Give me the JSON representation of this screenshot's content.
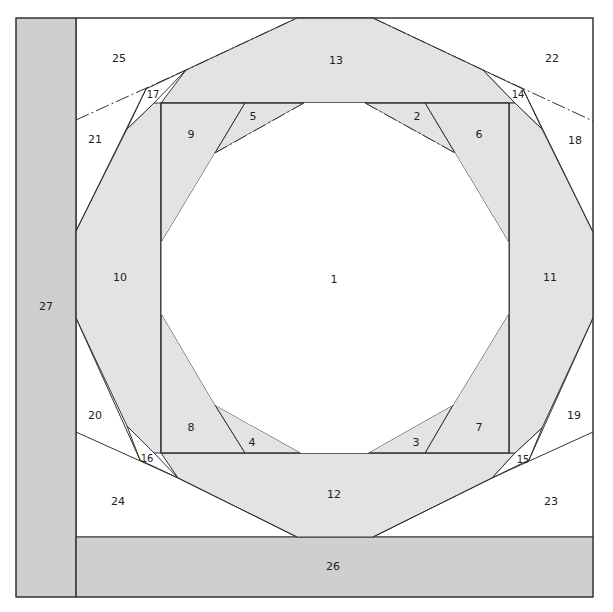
{
  "diagram": {
    "colors": {
      "light_shade": "#e3e3e3",
      "dark_shade": "#cfcfcf",
      "background": "#ffffff",
      "line": "#333333"
    },
    "pieces": [
      {
        "id": "1",
        "label": "1",
        "x": 334,
        "y": 279
      },
      {
        "id": "2",
        "label": "2",
        "x": 417,
        "y": 116
      },
      {
        "id": "3",
        "label": "3",
        "x": 416,
        "y": 442
      },
      {
        "id": "4",
        "label": "4",
        "x": 252,
        "y": 442
      },
      {
        "id": "5",
        "label": "5",
        "x": 253,
        "y": 116
      },
      {
        "id": "6",
        "label": "6",
        "x": 479,
        "y": 134
      },
      {
        "id": "7",
        "label": "7",
        "x": 479,
        "y": 427
      },
      {
        "id": "8",
        "label": "8",
        "x": 191,
        "y": 427
      },
      {
        "id": "9",
        "label": "9",
        "x": 191,
        "y": 134
      },
      {
        "id": "10",
        "label": "10",
        "x": 120,
        "y": 277
      },
      {
        "id": "11",
        "label": "11",
        "x": 550,
        "y": 277
      },
      {
        "id": "12",
        "label": "12",
        "x": 334,
        "y": 494
      },
      {
        "id": "13",
        "label": "13",
        "x": 336,
        "y": 60
      },
      {
        "id": "14",
        "label": "14",
        "x": 518,
        "y": 94
      },
      {
        "id": "15",
        "label": "15",
        "x": 523,
        "y": 459
      },
      {
        "id": "16",
        "label": "16",
        "x": 147,
        "y": 458
      },
      {
        "id": "17",
        "label": "17",
        "x": 153,
        "y": 94
      },
      {
        "id": "18",
        "label": "18",
        "x": 575,
        "y": 140
      },
      {
        "id": "19",
        "label": "19",
        "x": 574,
        "y": 415
      },
      {
        "id": "20",
        "label": "20",
        "x": 95,
        "y": 415
      },
      {
        "id": "21",
        "label": "21",
        "x": 95,
        "y": 139
      },
      {
        "id": "22",
        "label": "22",
        "x": 552,
        "y": 58
      },
      {
        "id": "23",
        "label": "23",
        "x": 551,
        "y": 501
      },
      {
        "id": "24",
        "label": "24",
        "x": 118,
        "y": 501
      },
      {
        "id": "25",
        "label": "25",
        "x": 119,
        "y": 58
      },
      {
        "id": "26",
        "label": "26",
        "x": 333,
        "y": 566
      },
      {
        "id": "27",
        "label": "27",
        "x": 46,
        "y": 306
      }
    ]
  }
}
